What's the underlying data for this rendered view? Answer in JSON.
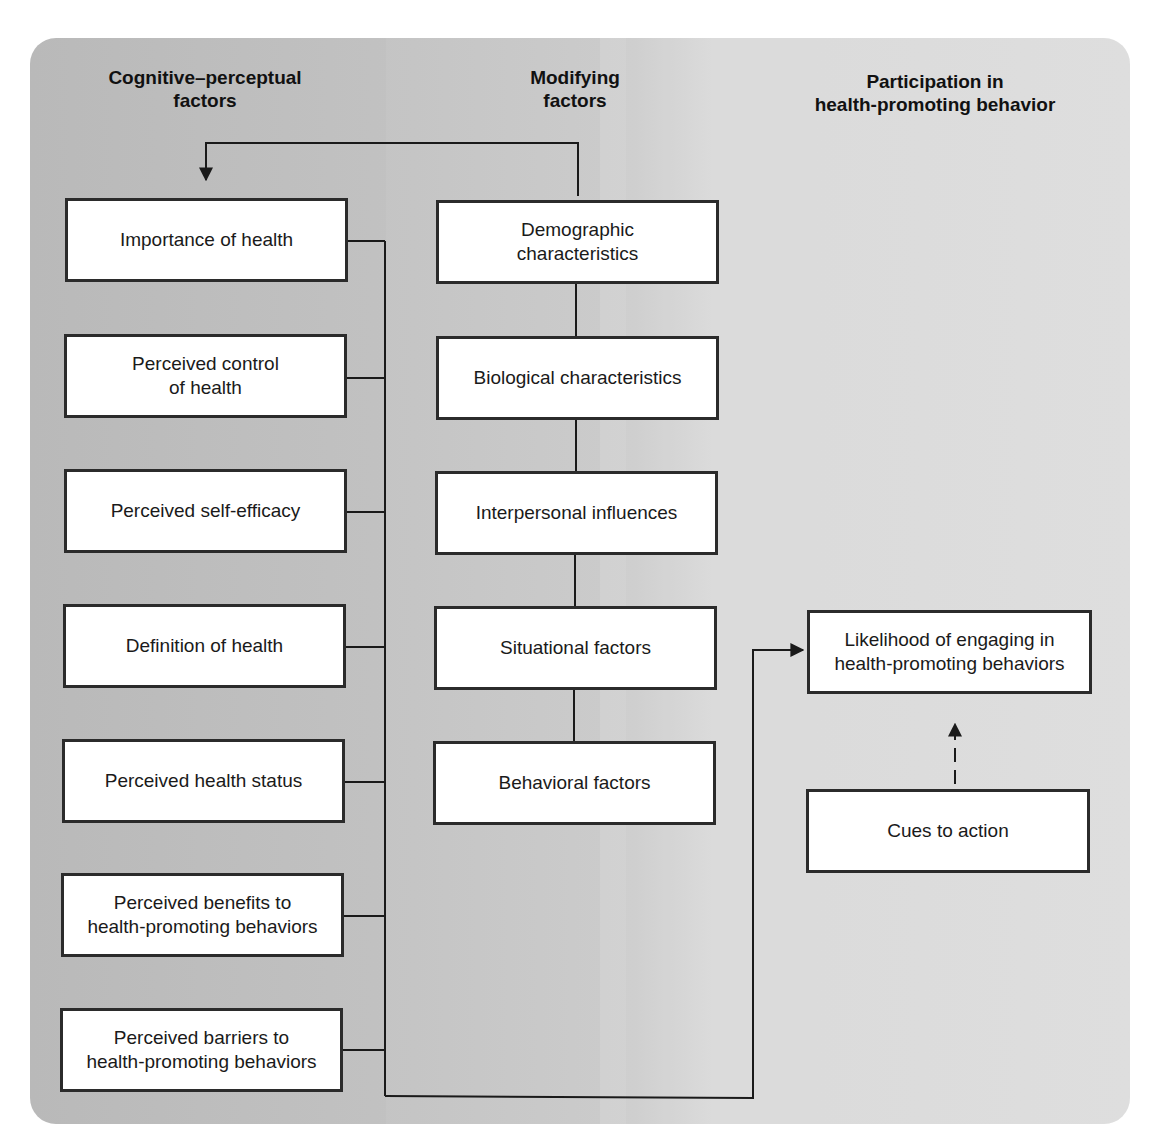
{
  "columns": {
    "cognitive": {
      "title": "Cognitive–perceptual\nfactors"
    },
    "modifying": {
      "title": "Modifying\nfactors"
    },
    "participation": {
      "title": "Participation in\nhealth-promoting behavior"
    }
  },
  "cognitive_factors": [
    "Importance of health",
    "Perceived control\nof health",
    "Perceived self-efficacy",
    "Definition of health",
    "Perceived health status",
    "Perceived benefits to\nhealth-promoting behaviors",
    "Perceived barriers to\nhealth-promoting behaviors"
  ],
  "modifying_factors": [
    "Demographic\ncharacteristics",
    "Biological characteristics",
    "Interpersonal influences",
    "Situational factors",
    "Behavioral factors"
  ],
  "participation": {
    "outcome": "Likelihood of engaging in\nhealth-promoting behaviors",
    "cues": "Cues to action"
  },
  "colors": {
    "panel_left": "#b9b9b9",
    "panel_right": "#dadada",
    "box_fill": "#ffffff",
    "line": "#1a1a1a"
  }
}
